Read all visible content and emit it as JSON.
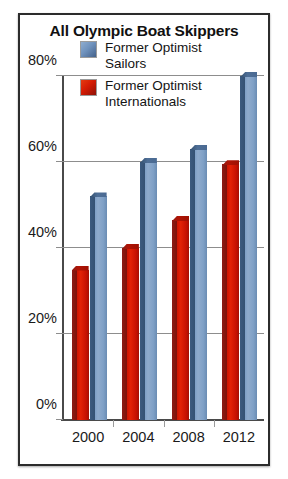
{
  "chart_data": {
    "type": "bar",
    "title": "All Olympic Boat Skippers",
    "xlabel": "",
    "ylabel": "",
    "categories": [
      "2000",
      "2004",
      "2008",
      "2012"
    ],
    "series": [
      {
        "name": "Former Optimist Internationals",
        "color": "#cf1402",
        "values": [
          35,
          40,
          46.5,
          59.5
        ]
      },
      {
        "name": "Former Optimist Sailors",
        "color": "#7e9fc6",
        "values": [
          52,
          60,
          63,
          80
        ]
      }
    ],
    "ylim": [
      0,
      80
    ],
    "ytick_values": [
      0,
      20,
      40,
      60,
      80
    ],
    "ytick_labels": [
      "0%",
      "20%",
      "40%",
      "60%",
      "80%"
    ],
    "grid": true,
    "legend_position": "top-inside"
  },
  "legend": {
    "items": [
      {
        "label": "Former Optimist\nSailors",
        "swatch": "blue"
      },
      {
        "label": "Former Optimist\nInternationals",
        "swatch": "red"
      }
    ]
  }
}
